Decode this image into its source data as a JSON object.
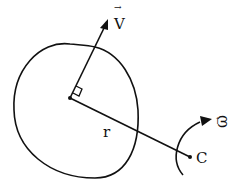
{
  "diagram": {
    "labels": {
      "velocity": "V",
      "radius": "r",
      "angular_velocity": "ω",
      "center_point": "C"
    },
    "colors": {
      "stroke": "#111111",
      "background": "#ffffff"
    }
  }
}
